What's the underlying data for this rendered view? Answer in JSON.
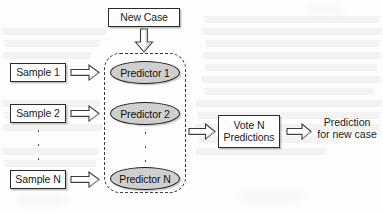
{
  "diagram": {
    "type": "flowchart",
    "colors": {
      "page_background": "#fdfdfd",
      "node_border": "#2b2b2b",
      "node_fill": "#ffffff",
      "predictor_fill": "#cfcfcf",
      "predictor_border": "#1f1f1f",
      "dashed_group_border": "#3b3b3b",
      "arrow_outline": "#3a3a3a",
      "arrow_fill": "#ffffff",
      "arrow_shade": "#c9c9c9",
      "text": "#1a1a1a"
    },
    "top_input": {
      "label": "New Case"
    },
    "samples": [
      {
        "label": "Sample 1"
      },
      {
        "label": "Sample 2"
      },
      {
        "label": "Sample N"
      }
    ],
    "predictors": [
      {
        "label": "Predictor 1"
      },
      {
        "label": "Predictor 2"
      },
      {
        "label": "Predictor N"
      }
    ],
    "ellipsis": {
      "symbol": "vertical-dots",
      "dot_count": 3
    },
    "aggregator": {
      "line1": "Vote N",
      "line2": "Predictions"
    },
    "output": {
      "line1": "Prediction",
      "line2": "for new case"
    },
    "arrows": [
      {
        "name": "new-case-to-predictors",
        "direction": "down"
      },
      {
        "name": "sample-1-to-predictor-1",
        "direction": "right"
      },
      {
        "name": "sample-2-to-predictor-2",
        "direction": "right"
      },
      {
        "name": "sample-n-to-predictor-n",
        "direction": "right"
      },
      {
        "name": "predictors-to-vote",
        "direction": "right"
      },
      {
        "name": "vote-to-prediction",
        "direction": "right"
      }
    ]
  }
}
